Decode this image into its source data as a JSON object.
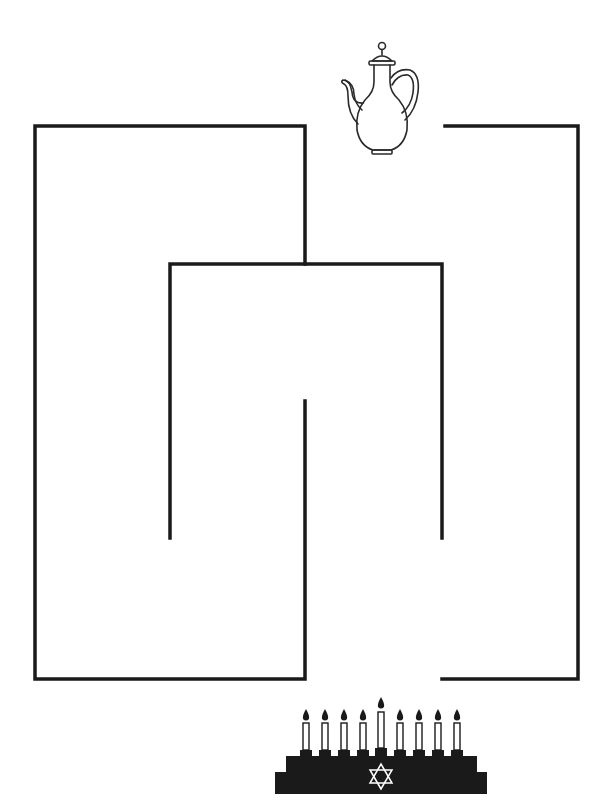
{
  "puzzle": {
    "type": "maze",
    "title": "Maze",
    "start_icon": "teapot-icon",
    "goal_icon": "menorah-icon",
    "menorah": {
      "candle_count": 9,
      "center_candle": "shamash",
      "emblem": "star-of-david-icon"
    }
  },
  "colors": {
    "background": "#ffffff",
    "wall": "#1a1a1a",
    "icon_stroke": "#2a2a2a",
    "menorah_fill": "#1a1a1a",
    "candle_fill": "#ffffff"
  }
}
